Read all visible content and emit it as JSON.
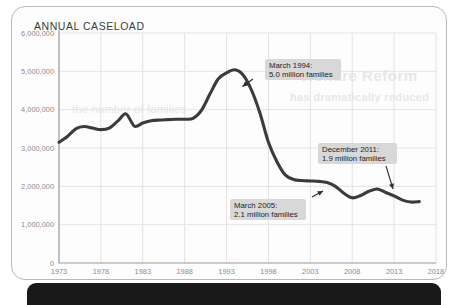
{
  "card": {
    "title": "ANNUAL CASELOAD"
  },
  "ghost_text": {
    "line1": "Welfare Reform",
    "line2": "has dramatically reduced",
    "line3": "the number of families"
  },
  "chart_data": {
    "type": "line",
    "title": "ANNUAL CASELOAD",
    "xlabel": "",
    "ylabel": "",
    "xlim": [
      1973,
      2018
    ],
    "ylim": [
      0,
      6000000
    ],
    "grid": true,
    "legend": "none",
    "x_ticks": [
      "1973",
      "1978",
      "1983",
      "1988",
      "1993",
      "1998",
      "2003",
      "2008",
      "2013",
      "2018"
    ],
    "y_ticks": [
      "0",
      "1,000,000",
      "2,000,000",
      "3,000,000",
      "4,000,000",
      "5,000,000",
      "6,000,000"
    ],
    "series": [
      {
        "name": "Annual caseload (families)",
        "color": "#3b3b3b",
        "x": [
          1973,
          1974,
          1975,
          1976,
          1977,
          1978,
          1979,
          1980,
          1981,
          1982,
          1983,
          1984,
          1985,
          1986,
          1987,
          1988,
          1989,
          1990,
          1991,
          1992,
          1993,
          1994,
          1995,
          1996,
          1997,
          1998,
          1999,
          2000,
          2001,
          2002,
          2003,
          2004,
          2005,
          2006,
          2007,
          2008,
          2009,
          2010,
          2011,
          2012,
          2013,
          2014,
          2015,
          2016
        ],
        "values": [
          3150000,
          3300000,
          3500000,
          3560000,
          3520000,
          3480000,
          3520000,
          3700000,
          3890000,
          3570000,
          3650000,
          3710000,
          3730000,
          3740000,
          3750000,
          3750000,
          3770000,
          3980000,
          4400000,
          4800000,
          4960000,
          5040000,
          4900000,
          4500000,
          3900000,
          3150000,
          2650000,
          2300000,
          2180000,
          2150000,
          2140000,
          2130000,
          2100000,
          2000000,
          1820000,
          1700000,
          1760000,
          1870000,
          1930000,
          1840000,
          1750000,
          1640000,
          1590000,
          1600000
        ]
      }
    ],
    "annotations": [
      {
        "id": "peak-1994",
        "line1": "March 1994:",
        "line2": "5.0 million families",
        "point_x": 1994,
        "point_y": 5040000
      },
      {
        "id": "dec-2011",
        "line1": "December 2011:",
        "line2": "1.9 million families",
        "point_x": 2011,
        "point_y": 1930000
      },
      {
        "id": "mar-2005",
        "line1": "March 2005:",
        "line2": "2.1 million families",
        "point_x": 2005,
        "point_y": 2100000
      }
    ]
  }
}
